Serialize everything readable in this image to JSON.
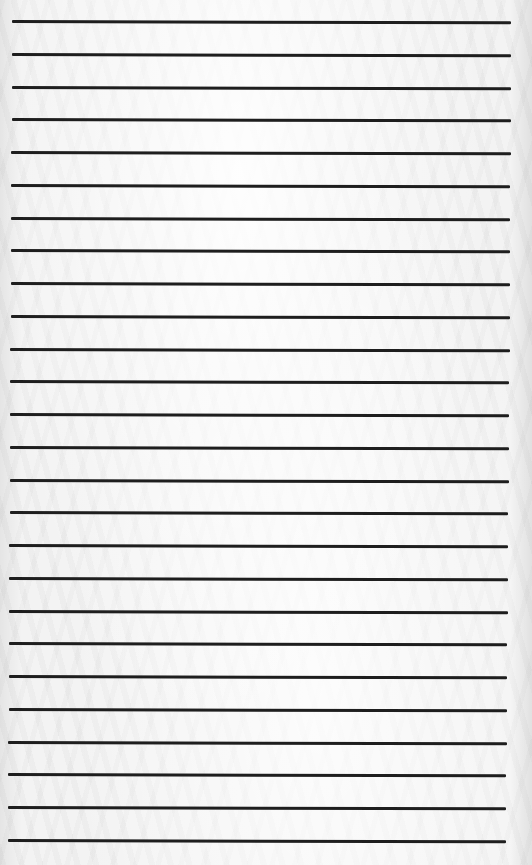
{
  "page": {
    "type": "lined-paper",
    "background_color": "#f3f3f3",
    "line_color": "#1e1e1e",
    "line_count": 26
  },
  "lines": [
    {
      "y": 21,
      "x1": 12,
      "x2": 511
    },
    {
      "y": 54,
      "x1": 12,
      "x2": 511
    },
    {
      "y": 87,
      "x1": 12,
      "x2": 511
    },
    {
      "y": 119,
      "x1": 12,
      "x2": 511
    },
    {
      "y": 152,
      "x1": 11,
      "x2": 511
    },
    {
      "y": 185,
      "x1": 11,
      "x2": 510
    },
    {
      "y": 218,
      "x1": 11,
      "x2": 510
    },
    {
      "y": 250,
      "x1": 11,
      "x2": 510
    },
    {
      "y": 283,
      "x1": 11,
      "x2": 510
    },
    {
      "y": 316,
      "x1": 11,
      "x2": 510
    },
    {
      "y": 349,
      "x1": 10,
      "x2": 510
    },
    {
      "y": 381,
      "x1": 10,
      "x2": 509
    },
    {
      "y": 414,
      "x1": 10,
      "x2": 509
    },
    {
      "y": 447,
      "x1": 10,
      "x2": 509
    },
    {
      "y": 480,
      "x1": 10,
      "x2": 509
    },
    {
      "y": 512,
      "x1": 10,
      "x2": 508
    },
    {
      "y": 545,
      "x1": 9,
      "x2": 508
    },
    {
      "y": 578,
      "x1": 9,
      "x2": 508
    },
    {
      "y": 611,
      "x1": 9,
      "x2": 508
    },
    {
      "y": 643,
      "x1": 9,
      "x2": 507
    },
    {
      "y": 676,
      "x1": 9,
      "x2": 507
    },
    {
      "y": 709,
      "x1": 9,
      "x2": 507
    },
    {
      "y": 742,
      "x1": 8,
      "x2": 507
    },
    {
      "y": 774,
      "x1": 8,
      "x2": 506
    },
    {
      "y": 807,
      "x1": 8,
      "x2": 506
    },
    {
      "y": 840,
      "x1": 8,
      "x2": 506
    }
  ]
}
